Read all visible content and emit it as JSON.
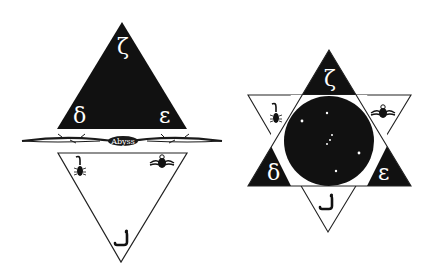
{
  "left_figure": {
    "upper_triangle": {
      "fill": "#111111",
      "glyphs": {
        "top": "ζ",
        "left": "δ",
        "right": "ε"
      }
    },
    "divider": {
      "label": "Abyss",
      "color": "#1a1a1a"
    },
    "lower_triangle": {
      "fill": "#ffffff",
      "stroke": "#222222",
      "symbols": [
        "scorpion-icon",
        "winged-scarab-icon",
        "serpent-icon"
      ]
    }
  },
  "right_figure": {
    "hexagram": {
      "dark_points": [
        "top",
        "left",
        "right"
      ],
      "light_points": [
        "upper-left",
        "upper-right",
        "bottom"
      ]
    },
    "glyphs": {
      "top": "ζ",
      "left": "δ",
      "right": "ε"
    },
    "center_circle": {
      "fill": "#111111",
      "stars": 7
    },
    "symbols": [
      "scorpion-icon",
      "winged-scarab-icon",
      "serpent-icon"
    ]
  },
  "colors": {
    "dark": "#111111",
    "background": "#ffffff",
    "line": "#222222"
  }
}
